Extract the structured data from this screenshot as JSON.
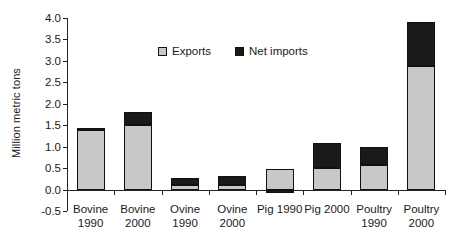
{
  "chart_data": {
    "type": "bar",
    "title": "",
    "subtitle": "",
    "xlabel": "",
    "ylabel": "Million metric tons",
    "stacked": true,
    "grid": false,
    "legend_position": "inside-top-center",
    "ylim": [
      -0.5,
      4.0
    ],
    "ytick_step": 0.5,
    "ytick_labels": [
      "4.0",
      "3.5",
      "3.0",
      "2.5",
      "2.0",
      "1.5",
      "1.0",
      "0.5",
      "0.0",
      "-0.5"
    ],
    "ytick_values": [
      4.0,
      3.5,
      3.0,
      2.5,
      2.0,
      1.5,
      1.0,
      0.5,
      0.0,
      -0.5
    ],
    "categories": [
      "Bovine 1990",
      "Bovine 2000",
      "Ovine 1990",
      "Ovine 2000",
      "Pig 1990",
      "Pig 2000",
      "Poultry 1990",
      "Poultry 2000"
    ],
    "category_lines": [
      [
        "Bovine",
        "1990"
      ],
      [
        "Bovine",
        "2000"
      ],
      [
        "Ovine",
        "1990"
      ],
      [
        "Ovine",
        "2000"
      ],
      [
        "Pig 1990",
        ""
      ],
      [
        "Pig 2000",
        ""
      ],
      [
        "Poultry",
        "1990"
      ],
      [
        "Poultry",
        "2000"
      ]
    ],
    "series": [
      {
        "name": "Exports",
        "color": "#c8c8c8",
        "values": [
          1.38,
          1.5,
          0.11,
          0.11,
          0.49,
          0.5,
          0.58,
          2.89
        ]
      },
      {
        "name": "Net imports",
        "color": "#1a1a1a",
        "values": [
          0.06,
          0.31,
          0.15,
          0.2,
          -0.09,
          0.58,
          0.42,
          1.02
        ]
      }
    ],
    "totals": [
      1.44,
      1.81,
      0.26,
      0.31,
      0.4,
      1.08,
      1.0,
      3.91
    ]
  },
  "legend": {
    "items": [
      {
        "label": "Exports",
        "color": "#c8c8c8"
      },
      {
        "label": "Net imports",
        "color": "#1a1a1a"
      }
    ]
  },
  "axes": {
    "y_title": "Million metric tons"
  }
}
